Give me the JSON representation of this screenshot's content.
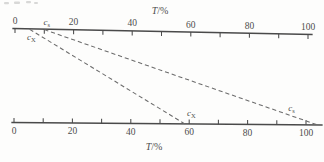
{
  "figure": {
    "background_color": "#fdfdfc",
    "colors": {
      "axis": "#4a4a4a",
      "dashed_line": "#6b6b6b",
      "text": "#4d4d4d"
    }
  },
  "chart_data": {
    "type": "nomogram",
    "axes": [
      {
        "id": "top",
        "title_base": "T",
        "title_rest": "/%",
        "range": [
          0,
          100
        ],
        "minor_tick_step": 10,
        "major_label_step": 20,
        "tick_labels": [
          "0",
          "20",
          "40",
          "60",
          "80",
          "100"
        ],
        "labels_side": "above",
        "ticks_side": "below",
        "point_labels": [
          {
            "base": "c",
            "sub": "s",
            "t": 10.8,
            "side": "above",
            "dy": 0
          },
          {
            "base": "c",
            "sub": "X",
            "t": 5.6,
            "side": "below",
            "dy": 0
          }
        ]
      },
      {
        "id": "bottom",
        "title_base": "T",
        "title_rest": "/%",
        "range": [
          0,
          100
        ],
        "minor_tick_step": 10,
        "major_label_step": 20,
        "tick_labels": [
          "0",
          "20",
          "40",
          "60",
          "80",
          "100"
        ],
        "labels_side": "below",
        "ticks_side": "above",
        "point_labels": [
          {
            "base": "c",
            "sub": "X",
            "t": 60.7,
            "side": "above",
            "dy": 0
          },
          {
            "base": "c",
            "sub": "s",
            "t": 95,
            "side": "above",
            "dy": -6
          }
        ]
      }
    ],
    "projection_lines": [
      {
        "name": "cX-projection",
        "from_top_t": 5,
        "to_bottom_t": 58.5
      },
      {
        "name": "cs-projection",
        "from_top_t": 10,
        "to_bottom_t": 104
      }
    ]
  }
}
